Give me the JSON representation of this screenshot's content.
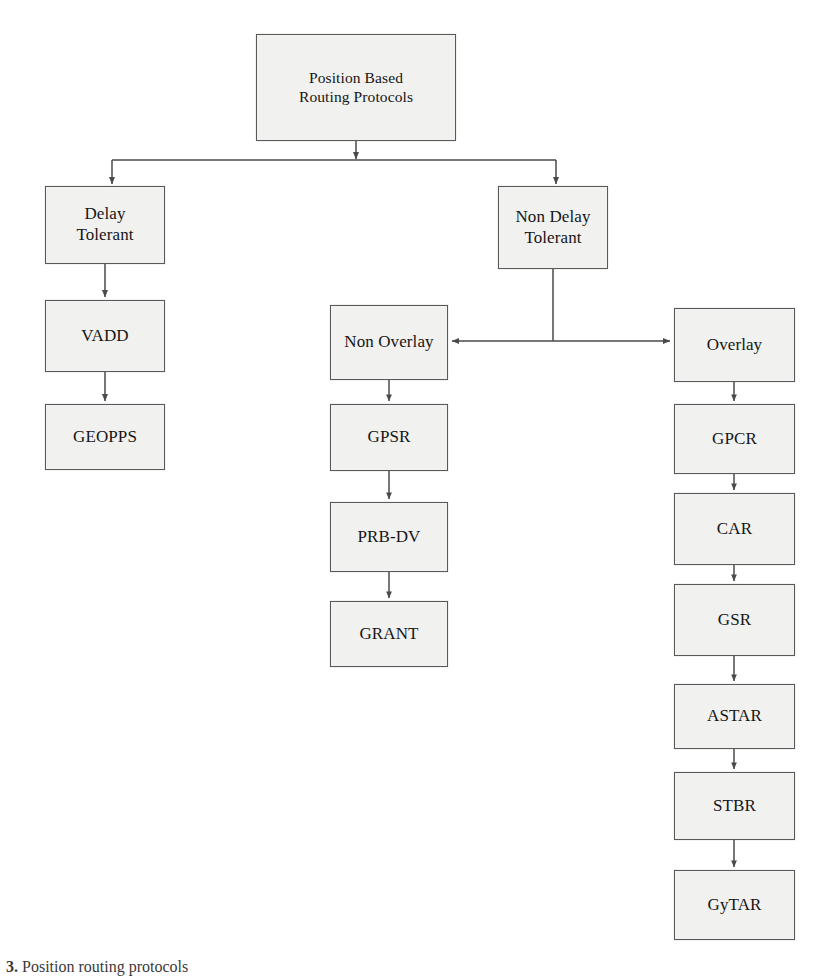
{
  "figure": {
    "caption_prefix": "3.",
    "caption_text": "Position  routing protocols",
    "line_color": "#4a4a4a",
    "box_fill": "#f1f1f0",
    "box_border": "#595959",
    "background": "#ffffff"
  },
  "nodes": [
    {
      "id": "root",
      "label": "Position Based\nRouting Protocols",
      "x": 256,
      "y": 34,
      "w": 200,
      "h": 107
    },
    {
      "id": "delay",
      "label": "Delay\nTolerant",
      "x": 45,
      "y": 186,
      "w": 120,
      "h": 78
    },
    {
      "id": "nondelay",
      "label": "Non Delay\nTolerant",
      "x": 498,
      "y": 186,
      "w": 110,
      "h": 83
    },
    {
      "id": "vadd",
      "label": "VADD",
      "x": 45,
      "y": 300,
      "w": 120,
      "h": 72
    },
    {
      "id": "geopps",
      "label": "GEOPPS",
      "x": 45,
      "y": 404,
      "w": 120,
      "h": 66
    },
    {
      "id": "nonoverlay",
      "label": "Non Overlay",
      "x": 330,
      "y": 305,
      "w": 118,
      "h": 75
    },
    {
      "id": "overlay",
      "label": "Overlay",
      "x": 674,
      "y": 308,
      "w": 121,
      "h": 74
    },
    {
      "id": "gpsr",
      "label": "GPSR",
      "x": 330,
      "y": 404,
      "w": 118,
      "h": 67
    },
    {
      "id": "prbdv",
      "label": "PRB-DV",
      "x": 330,
      "y": 502,
      "w": 118,
      "h": 70
    },
    {
      "id": "grant",
      "label": "GRANT",
      "x": 330,
      "y": 601,
      "w": 118,
      "h": 66
    },
    {
      "id": "gpcr",
      "label": "GPCR",
      "x": 674,
      "y": 404,
      "w": 121,
      "h": 70
    },
    {
      "id": "car",
      "label": "CAR",
      "x": 674,
      "y": 493,
      "w": 121,
      "h": 72
    },
    {
      "id": "gsr",
      "label": "GSR",
      "x": 674,
      "y": 584,
      "w": 121,
      "h": 72
    },
    {
      "id": "astar",
      "label": "ASTAR",
      "x": 674,
      "y": 684,
      "w": 121,
      "h": 65
    },
    {
      "id": "stbr",
      "label": "STBR",
      "x": 674,
      "y": 772,
      "w": 121,
      "h": 68
    },
    {
      "id": "gytar",
      "label": "GyTAR",
      "x": 674,
      "y": 870,
      "w": 121,
      "h": 70
    }
  ],
  "edges": [
    {
      "from": "root",
      "to": "split-bar",
      "kind": "vertical-stem"
    },
    {
      "from": "split-bar",
      "to": "delay",
      "kind": "drop-arrow"
    },
    {
      "from": "split-bar",
      "to": "nondelay",
      "kind": "drop-arrow"
    },
    {
      "from": "delay",
      "to": "vadd",
      "kind": "vertical-arrow"
    },
    {
      "from": "vadd",
      "to": "geopps",
      "kind": "vertical-arrow"
    },
    {
      "from": "nondelay",
      "to": "cross-bar",
      "kind": "vertical-stem"
    },
    {
      "from": "cross-bar",
      "to": "nonoverlay",
      "kind": "left-arrow"
    },
    {
      "from": "cross-bar",
      "to": "overlay",
      "kind": "right-arrow"
    },
    {
      "from": "nonoverlay",
      "to": "gpsr",
      "kind": "vertical-arrow"
    },
    {
      "from": "gpsr",
      "to": "prbdv",
      "kind": "vertical-arrow"
    },
    {
      "from": "prbdv",
      "to": "grant",
      "kind": "vertical-arrow"
    },
    {
      "from": "overlay",
      "to": "gpcr",
      "kind": "vertical-arrow"
    },
    {
      "from": "gpcr",
      "to": "car",
      "kind": "vertical-arrow"
    },
    {
      "from": "car",
      "to": "gsr",
      "kind": "vertical-arrow"
    },
    {
      "from": "gsr",
      "to": "astar",
      "kind": "vertical-arrow"
    },
    {
      "from": "astar",
      "to": "stbr",
      "kind": "vertical-arrow"
    },
    {
      "from": "stbr",
      "to": "gytar",
      "kind": "vertical-arrow"
    }
  ]
}
